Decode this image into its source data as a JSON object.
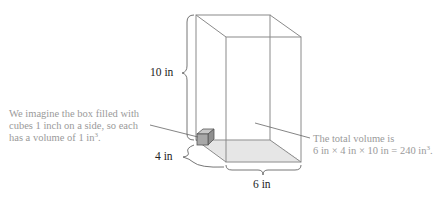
{
  "diagram": {
    "type": "rectangular-prism-volume",
    "dimension_labels": {
      "height": "10 in",
      "depth": "4 in",
      "width": "6 in"
    },
    "left_note": {
      "line1": "We imagine the box filled with",
      "line2": "cubes 1 inch on a side, so each",
      "line3_prefix": "has a volume of 1 in",
      "line3_sup": "3",
      "line3_suffix": "."
    },
    "right_note": {
      "line1": "The total volume is",
      "line2_prefix": "6 in × 4 in × 10 in = 240 in",
      "line2_sup": "3",
      "line2_suffix": "."
    },
    "colors": {
      "edge": "#8a8a8a",
      "base_grid": "#dcdcdc",
      "cube": "#9c9c9c",
      "note_text": "#9a9a9a",
      "label_text": "#222222"
    }
  }
}
